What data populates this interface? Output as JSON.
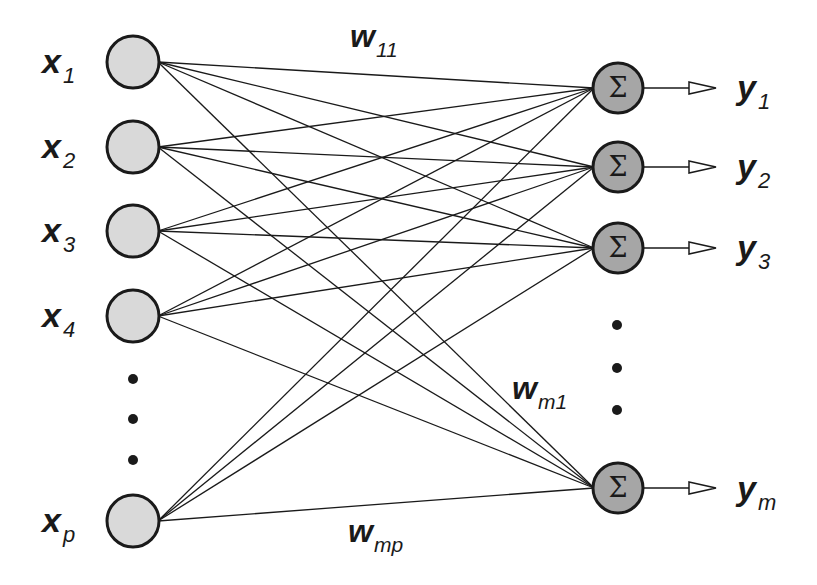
{
  "diagram": {
    "type": "single-layer neural network",
    "inputs": [
      {
        "var": "x",
        "sub": "1",
        "cy": 62
      },
      {
        "var": "x",
        "sub": "2",
        "cy": 147
      },
      {
        "var": "x",
        "sub": "3",
        "cy": 231
      },
      {
        "var": "x",
        "sub": "4",
        "cy": 316
      },
      {
        "var": "x",
        "sub": "p",
        "cy": 521
      }
    ],
    "outputs": [
      {
        "var": "y",
        "sub": "1",
        "cy": 88,
        "symbol": "Σ"
      },
      {
        "var": "y",
        "sub": "2",
        "cy": 167,
        "symbol": "Σ"
      },
      {
        "var": "y",
        "sub": "3",
        "cy": 248,
        "symbol": "Σ"
      },
      {
        "var": "y",
        "sub": "m",
        "cy": 488,
        "symbol": "Σ"
      }
    ],
    "weights": [
      {
        "var": "w",
        "sub": "11"
      },
      {
        "var": "w",
        "sub": "m1"
      },
      {
        "var": "w",
        "sub": "mp"
      }
    ],
    "ellipsis": "⋮",
    "colors": {
      "input_fill": "#d9d9d9",
      "output_fill": "#a6a6a6",
      "stroke": "#1a1a1a",
      "background": "#ffffff"
    }
  }
}
